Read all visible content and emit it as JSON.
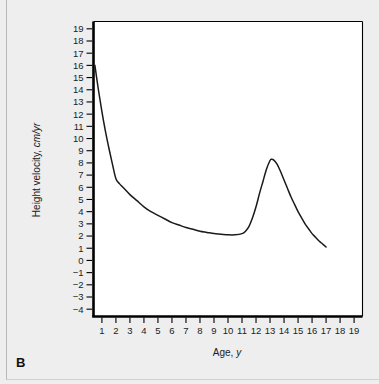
{
  "figure": {
    "panel_label": "B",
    "background_color": "#eeeeee",
    "plot_background_color": "#ffffff",
    "frame_color": "#000000",
    "curve_color": "#1a1a1a"
  },
  "chart_data": {
    "type": "line",
    "title": "",
    "subtitle": "",
    "xlabel_text": "Age, ",
    "xlabel_em": "y",
    "ylabel_text": "Height velocity, ",
    "ylabel_em": "cm/yr",
    "xlim": [
      0.4,
      19.6
    ],
    "ylim": [
      -4.6,
      19.6
    ],
    "grid": false,
    "legend": "none",
    "x_ticks": [
      1,
      2,
      3,
      4,
      5,
      6,
      7,
      8,
      9,
      10,
      11,
      12,
      13,
      14,
      15,
      16,
      17,
      18,
      19
    ],
    "x_tick_labels": [
      "1",
      "2",
      "3",
      "4",
      "5",
      "6",
      "7",
      "8",
      "9",
      "10",
      "11",
      "12",
      "13",
      "14",
      "15",
      "16",
      "17",
      "18",
      "19"
    ],
    "y_ticks": [
      19,
      18,
      17,
      16,
      15,
      14,
      13,
      12,
      11,
      10,
      9,
      8,
      7,
      6,
      5,
      4,
      3,
      2,
      1,
      0,
      -1,
      -2,
      -3,
      -4
    ],
    "y_tick_labels": [
      "19",
      "18",
      "17",
      "16",
      "15",
      "14",
      "13",
      "12",
      "11",
      "10",
      "9",
      "8",
      "7",
      "6",
      "5",
      "4",
      "3",
      "2",
      "1",
      "0",
      "−1",
      "−2",
      "−3",
      "−4"
    ],
    "series": [
      {
        "name": "Height velocity",
        "x": [
          0.5,
          0.75,
          1.0,
          1.25,
          1.5,
          1.75,
          2.0,
          2.25,
          2.5,
          3.0,
          3.5,
          4.0,
          4.5,
          5.0,
          5.5,
          6.0,
          6.5,
          7.0,
          7.5,
          8.0,
          8.5,
          9.0,
          9.5,
          10.0,
          10.5,
          11.0,
          11.25,
          11.5,
          11.75,
          12.0,
          12.25,
          12.5,
          12.75,
          13.0,
          13.1,
          13.25,
          13.5,
          13.75,
          14.0,
          14.25,
          14.5,
          14.75,
          15.0,
          15.25,
          15.5,
          15.75,
          16.0,
          16.25,
          16.5,
          16.75,
          17.0
        ],
        "y": [
          16.0,
          14.0,
          12.2,
          10.6,
          9.2,
          7.9,
          6.7,
          6.3,
          6.0,
          5.4,
          4.9,
          4.4,
          4.0,
          3.7,
          3.4,
          3.1,
          2.9,
          2.7,
          2.55,
          2.4,
          2.3,
          2.2,
          2.15,
          2.1,
          2.1,
          2.2,
          2.4,
          2.8,
          3.5,
          4.4,
          5.5,
          6.5,
          7.5,
          8.2,
          8.3,
          8.25,
          7.9,
          7.3,
          6.6,
          5.9,
          5.2,
          4.6,
          4.0,
          3.5,
          3.0,
          2.6,
          2.2,
          1.9,
          1.6,
          1.35,
          1.1
        ]
      }
    ]
  }
}
